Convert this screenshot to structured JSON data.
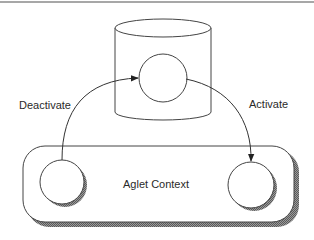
{
  "diagram": {
    "type": "aglet-lifecycle",
    "nodes": {
      "storage": {
        "shape": "cylinder",
        "label": ""
      },
      "stored_aglet": {
        "shape": "circle",
        "container": "storage"
      },
      "context": {
        "shape": "rounded-rectangle",
        "label": "Aglet Context"
      },
      "source_aglet": {
        "shape": "circle",
        "container": "context"
      },
      "target_aglet": {
        "shape": "circle",
        "container": "context"
      }
    },
    "edges": [
      {
        "from": "source_aglet",
        "to": "stored_aglet",
        "label": "Deactivate"
      },
      {
        "from": "stored_aglet",
        "to": "target_aglet",
        "label": "Activate"
      }
    ]
  },
  "labels": {
    "deactivate": "Deactivate",
    "activate": "Activate",
    "context": "Aglet Context"
  },
  "colors": {
    "stroke": "#333333",
    "shadow": "#777777",
    "rule": "#8a8a8a",
    "text": "#2a2a2a",
    "background": "#ffffff"
  }
}
